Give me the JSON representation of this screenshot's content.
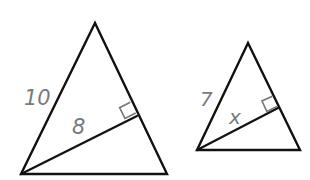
{
  "diagram": {
    "colors": {
      "lines": "#111111",
      "labels": "#7a7a7a",
      "right_angle_mark": "#777777",
      "background": "#ffffff"
    },
    "triangles": [
      {
        "id": "large",
        "vertices": {
          "apex": [
            95,
            23
          ],
          "bottom_left": [
            21,
            174
          ],
          "bottom_right": [
            167,
            174
          ]
        },
        "altitude_foot": [
          137,
          116
        ],
        "labels": {
          "side": "10",
          "altitude": "8"
        },
        "label_positions": {
          "side": [
            24,
            105
          ],
          "altitude": [
            72,
            134
          ]
        },
        "right_angle_mark": true
      },
      {
        "id": "small",
        "vertices": {
          "apex": [
            248,
            43
          ],
          "bottom_left": [
            197,
            150
          ],
          "bottom_right": [
            300,
            150
          ]
        },
        "altitude_foot": [
          278,
          108
        ],
        "labels": {
          "side": "7",
          "altitude": "x"
        },
        "label_positions": {
          "side": [
            200,
            106
          ],
          "altitude": [
            229,
            124
          ]
        },
        "right_angle_mark": true
      }
    ]
  }
}
